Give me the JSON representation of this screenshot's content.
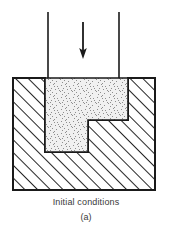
{
  "figure": {
    "caption": "Initial conditions",
    "sub_caption": "(a)",
    "title": "Initial conditions",
    "kind": "engineering-cross-section"
  },
  "colors": {
    "outline": "#1a1a1a",
    "hatch_line": "#1a1a1a",
    "billet_fill": "#ededed",
    "stipple_dot": "#8a8a8a",
    "background": "#ffffff",
    "arrow": "#1a1a1a",
    "caption_text": "#3a3a3a"
  },
  "parts": {
    "die_body": {
      "label": "die-body",
      "outer_left": 13,
      "outer_right": 155,
      "outer_top": 78,
      "outer_bottom": 190,
      "hatch_angle_deg": 45,
      "hatch_spacing": 9
    },
    "billet": {
      "label": "billet-cavity",
      "upper_left": 45,
      "upper_right": 128,
      "top": 78,
      "step_y": 120,
      "lower_right": 88,
      "bottom": 152,
      "fill": "stipple"
    },
    "punch": {
      "label": "punch",
      "left_line_x": 48,
      "right_line_x": 119,
      "top_y": 12,
      "bottom_y": 78
    },
    "force_arrow": {
      "label": "downward-force-arrow",
      "x": 83,
      "top_y": 22,
      "bottom_y": 57,
      "direction": "down"
    }
  }
}
